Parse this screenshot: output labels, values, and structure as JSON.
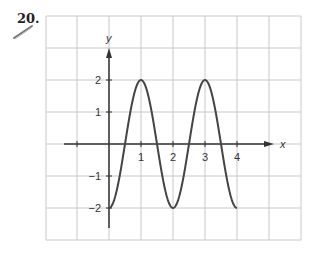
{
  "problem": {
    "number_label": "20."
  },
  "chart_data": {
    "type": "line",
    "title": "",
    "xlabel": "x",
    "ylabel": "y",
    "function": "y = -2cos(πx)",
    "x_range": [
      0,
      4
    ],
    "xlim": [
      -1.4,
      5
    ],
    "ylim": [
      -2.6,
      2.9
    ],
    "x_ticks": [
      -1,
      1,
      2,
      3,
      4
    ],
    "x_tick_labels": [
      "1",
      "2",
      "3",
      "4"
    ],
    "y_ticks": [
      2,
      1,
      -1,
      -2
    ],
    "y_tick_labels": [
      "2",
      "1",
      "−1",
      "−2"
    ],
    "grid": true,
    "x": [
      0,
      0.5,
      1,
      1.5,
      2,
      2.5,
      3,
      3.5,
      4
    ],
    "series": [
      {
        "name": "curve",
        "values": [
          -2,
          0,
          2,
          0,
          -2,
          0,
          2,
          0,
          -2
        ]
      }
    ],
    "key_points": {
      "maxima": [
        [
          1,
          2
        ],
        [
          3,
          2
        ]
      ],
      "minima": [
        [
          0,
          -2
        ],
        [
          2,
          -2
        ],
        [
          4,
          -2
        ]
      ],
      "zeros": [
        0.5,
        1.5,
        2.5,
        3.5
      ]
    },
    "colors": {
      "grid": "#c8c8c8",
      "axis": "#333333",
      "curve": "#444444"
    }
  }
}
